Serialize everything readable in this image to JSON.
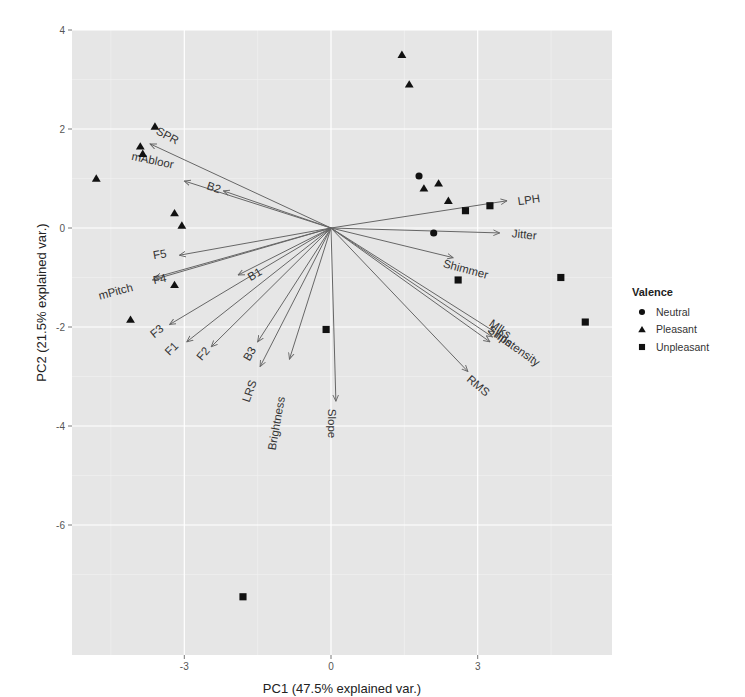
{
  "chart_data": {
    "type": "scatter",
    "subtype": "pca-biplot",
    "title": "",
    "xlabel": "PC1 (47.5% explained var.)",
    "ylabel": "PC2 (21.5% explained var.)",
    "xlim": [
      -5.2,
      5.8
    ],
    "ylim": [
      -8.0,
      4.0
    ],
    "x_ticks": [
      -3,
      0,
      3
    ],
    "y_ticks": [
      4,
      2,
      0,
      -2,
      -4,
      -6
    ],
    "grid": true,
    "legend": {
      "title": "Valence",
      "position": "right",
      "entries": [
        {
          "label": "Neutral",
          "shape": "circle"
        },
        {
          "label": "Pleasant",
          "shape": "triangle"
        },
        {
          "label": "Unpleasant",
          "shape": "square"
        }
      ]
    },
    "series": [
      {
        "name": "Neutral",
        "shape": "circle",
        "points": [
          [
            1.8,
            1.05
          ],
          [
            2.1,
            -0.1
          ]
        ]
      },
      {
        "name": "Pleasant",
        "shape": "triangle",
        "points": [
          [
            -4.8,
            1.0
          ],
          [
            -3.6,
            2.05
          ],
          [
            -3.9,
            1.65
          ],
          [
            -3.85,
            1.5
          ],
          [
            -3.2,
            0.3
          ],
          [
            -3.05,
            0.05
          ],
          [
            -3.2,
            -1.15
          ],
          [
            -4.1,
            -1.85
          ],
          [
            1.45,
            3.5
          ],
          [
            1.6,
            2.9
          ],
          [
            1.9,
            0.8
          ],
          [
            2.2,
            0.9
          ],
          [
            2.4,
            0.55
          ]
        ]
      },
      {
        "name": "Unpleasant",
        "shape": "square",
        "points": [
          [
            2.75,
            0.35
          ],
          [
            3.25,
            0.45
          ],
          [
            2.6,
            -1.05
          ],
          [
            4.7,
            -1.0
          ],
          [
            5.2,
            -1.9
          ],
          [
            -0.1,
            -2.05
          ],
          [
            -1.8,
            -7.45
          ]
        ]
      }
    ],
    "loadings": [
      {
        "name": "SPR",
        "x": -3.7,
        "y": 1.7
      },
      {
        "name": "mAbloor",
        "x": -3.0,
        "y": 0.95
      },
      {
        "name": "B2",
        "x": -2.2,
        "y": 0.75
      },
      {
        "name": "LPH",
        "x": 3.6,
        "y": 0.55
      },
      {
        "name": "Jitter",
        "x": 3.45,
        "y": -0.1
      },
      {
        "name": "Shimmer",
        "x": 2.5,
        "y": -0.6
      },
      {
        "name": "Mlks",
        "x": 3.35,
        "y": -2.1
      },
      {
        "name": "Sllips",
        "x": 3.3,
        "y": -2.2
      },
      {
        "name": "mIntensity",
        "x": 3.25,
        "y": -2.3
      },
      {
        "name": "RMS",
        "x": 2.8,
        "y": -2.9
      },
      {
        "name": "F5",
        "x": -3.1,
        "y": -0.55
      },
      {
        "name": "F4",
        "x": -3.6,
        "y": -1.0
      },
      {
        "name": "mPitch",
        "x": -3.65,
        "y": -1.05
      },
      {
        "name": "B1",
        "x": -1.9,
        "y": -0.95
      },
      {
        "name": "F3",
        "x": -3.3,
        "y": -1.95
      },
      {
        "name": "F1",
        "x": -2.95,
        "y": -2.3
      },
      {
        "name": "F2",
        "x": -2.45,
        "y": -2.4
      },
      {
        "name": "B3",
        "x": -1.5,
        "y": -2.3
      },
      {
        "name": "LRS",
        "x": -1.45,
        "y": -2.8
      },
      {
        "name": "Brightness",
        "x": -0.85,
        "y": -2.65
      },
      {
        "name": "Slope",
        "x": 0.1,
        "y": -3.5
      }
    ],
    "loading_labels": [
      {
        "text": "SPR",
        "x": -3.35,
        "y": 1.85,
        "rot": 28
      },
      {
        "text": "mAbloor",
        "x": -3.65,
        "y": 1.35,
        "rot": 12
      },
      {
        "text": "B2",
        "x": -2.4,
        "y": 0.8,
        "rot": 18
      },
      {
        "text": "LPH",
        "x": 4.05,
        "y": 0.55,
        "rot": -8
      },
      {
        "text": "Jitter",
        "x": 3.95,
        "y": -0.15,
        "rot": 5
      },
      {
        "text": "Shimmer",
        "x": 2.75,
        "y": -0.85,
        "rot": 15
      },
      {
        "text": "Mlks",
        "x": 3.45,
        "y": -2.05,
        "rot": 35
      },
      {
        "text": "Sllips",
        "x": 3.45,
        "y": -2.2,
        "rot": 35
      },
      {
        "text": "mIntensity",
        "x": 3.8,
        "y": -2.45,
        "rot": 35
      },
      {
        "text": "RMS",
        "x": 3.0,
        "y": -3.2,
        "rot": 40
      },
      {
        "text": "F5",
        "x": -3.5,
        "y": -0.55,
        "rot": -10
      },
      {
        "text": "F4",
        "x": -3.5,
        "y": -1.05,
        "rot": -12
      },
      {
        "text": "mPitch",
        "x": -4.4,
        "y": -1.3,
        "rot": -15
      },
      {
        "text": "B1",
        "x": -1.55,
        "y": -0.95,
        "rot": -30
      },
      {
        "text": "F3",
        "x": -3.55,
        "y": -2.1,
        "rot": -40
      },
      {
        "text": "F1",
        "x": -3.25,
        "y": -2.45,
        "rot": -45
      },
      {
        "text": "F2",
        "x": -2.6,
        "y": -2.55,
        "rot": -50
      },
      {
        "text": "B3",
        "x": -1.65,
        "y": -2.55,
        "rot": -60
      },
      {
        "text": "LRS",
        "x": -1.65,
        "y": -3.3,
        "rot": -70
      },
      {
        "text": "Brightness",
        "x": -1.1,
        "y": -3.95,
        "rot": -80
      },
      {
        "text": "Slope",
        "x": 0.0,
        "y": -3.95,
        "rot": 90
      }
    ]
  },
  "colors": {
    "panel_bg": "#e6e6e6",
    "grid_major": "#ffffff",
    "grid_minor": "#f2f2f2",
    "arrow": "#666666",
    "point": "#111111"
  }
}
